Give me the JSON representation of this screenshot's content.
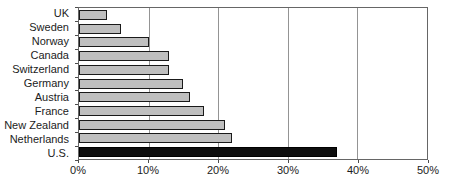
{
  "chart_data": {
    "type": "bar",
    "orientation": "horizontal",
    "title": "",
    "xlabel": "",
    "ylabel": "",
    "categories": [
      "UK",
      "Sweden",
      "Norway",
      "Canada",
      "Switzerland",
      "Germany",
      "Austria",
      "France",
      "New Zealand",
      "Netherlands",
      "U.S."
    ],
    "values": [
      4,
      6,
      10,
      13,
      13,
      15,
      16,
      18,
      21,
      22,
      37
    ],
    "unit": "%",
    "xlim": [
      0,
      50
    ],
    "x_ticks": [
      {
        "value": 0,
        "label": "0%"
      },
      {
        "value": 10,
        "label": "10%"
      },
      {
        "value": 20,
        "label": "20%"
      },
      {
        "value": 30,
        "label": "30%"
      },
      {
        "value": 40,
        "label": "40%"
      },
      {
        "value": 50,
        "label": "50%"
      }
    ],
    "grid": true,
    "legend": null,
    "highlight_category": "U.S.",
    "colors": {
      "bar_fill": "#bfbfbf",
      "bar_border": "#1a1a1a",
      "highlight_fill": "#0e0e0e",
      "highlight_border": "#000000",
      "gridline": "#949494",
      "plot_border": "#666666",
      "axis_tick": "#4d4d4d",
      "background": "#ffffff",
      "text": "#1c1c1c"
    }
  }
}
